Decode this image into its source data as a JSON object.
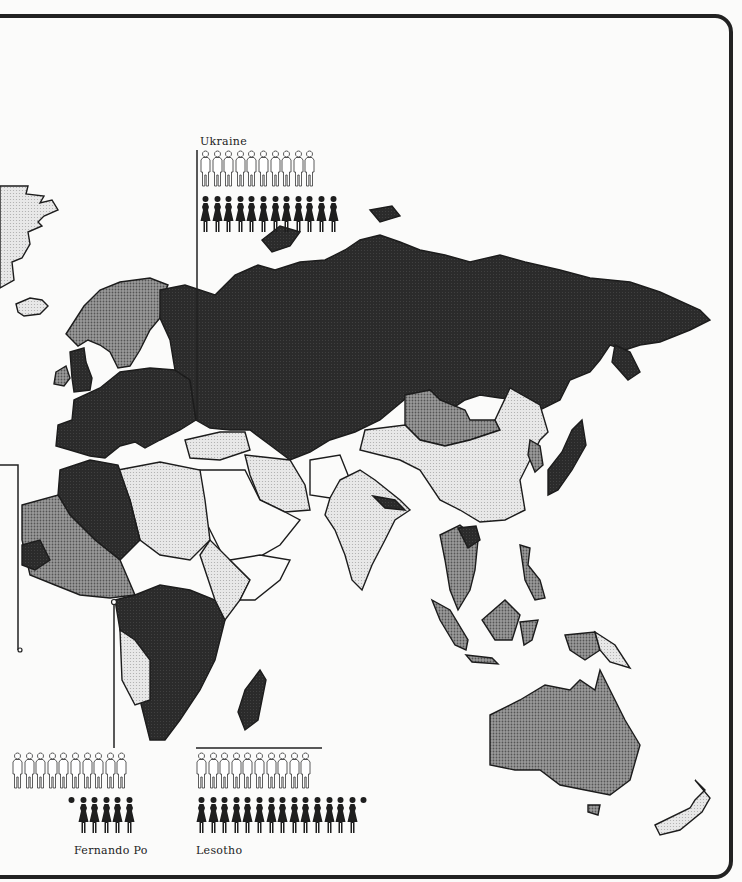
{
  "legend": {
    "male_icon": "male-outline-icon",
    "female_icon": "female-solid-icon",
    "shade_levels": [
      {
        "name": "dark",
        "color": "#2a2a2a"
      },
      {
        "name": "medium",
        "color": "#8a8a8a"
      },
      {
        "name": "light",
        "color": "#d6d6d6"
      },
      {
        "name": "white",
        "color": "#fbfbfa"
      }
    ]
  },
  "callouts": [
    {
      "id": "ukraine",
      "label": "Ukraine",
      "men": 10,
      "women": 12,
      "women_partial": false
    },
    {
      "id": "fernando-po",
      "label": "Fernando Po",
      "men": 10,
      "women": 5,
      "women_partial": true
    },
    {
      "id": "lesotho",
      "label": "Lesotho",
      "men": 10,
      "women": 14,
      "women_partial": true
    }
  ],
  "regions": [
    {
      "name": "Greenland",
      "shade": "light"
    },
    {
      "name": "Iceland",
      "shade": "light"
    },
    {
      "name": "Scandinavia",
      "shade": "medium"
    },
    {
      "name": "Ireland",
      "shade": "medium"
    },
    {
      "name": "Western Europe",
      "shade": "dark"
    },
    {
      "name": "USSR",
      "shade": "dark"
    },
    {
      "name": "Mongolia",
      "shade": "medium"
    },
    {
      "name": "China",
      "shade": "light"
    },
    {
      "name": "Korea",
      "shade": "medium"
    },
    {
      "name": "Japan",
      "shade": "dark"
    },
    {
      "name": "India",
      "shade": "light"
    },
    {
      "name": "Nepal",
      "shade": "dark"
    },
    {
      "name": "Southeast Asia",
      "shade": "medium"
    },
    {
      "name": "Indonesia",
      "shade": "medium"
    },
    {
      "name": "Papua New Guinea",
      "shade": "light"
    },
    {
      "name": "Australia",
      "shade": "medium"
    },
    {
      "name": "New Zealand",
      "shade": "light"
    },
    {
      "name": "North Africa",
      "shade": "light"
    },
    {
      "name": "Algeria",
      "shade": "dark"
    },
    {
      "name": "West Africa",
      "shade": "medium"
    },
    {
      "name": "Central Africa",
      "shade": "dark"
    },
    {
      "name": "East Africa",
      "shade": "light"
    },
    {
      "name": "Madagascar",
      "shade": "dark"
    },
    {
      "name": "Arabia",
      "shade": "white"
    },
    {
      "name": "Iran",
      "shade": "light"
    }
  ]
}
